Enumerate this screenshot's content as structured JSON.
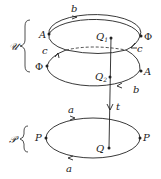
{
  "diagram": {
    "groups": [
      {
        "name": "upper",
        "brace_label": "𝒰"
      },
      {
        "name": "lower",
        "brace_label": "𝒫"
      }
    ],
    "top_loop": {
      "edge_label": "b",
      "points": [
        "A",
        "Φ"
      ],
      "center_point": "Q",
      "center_sub": "1",
      "cross_label": "c"
    },
    "middle_loop": {
      "edge_label": "b",
      "points": [
        "Φ",
        "A"
      ],
      "center_point": "Q",
      "center_sub": "2",
      "cross_label": "c"
    },
    "bottom_loop": {
      "edge_label_top": "a",
      "edge_label_bottom": "a",
      "points": [
        "P",
        "P"
      ],
      "center_point": "Q"
    },
    "map_label": "t",
    "colors": {
      "stroke": "#222222",
      "background": "#ffffff"
    }
  }
}
